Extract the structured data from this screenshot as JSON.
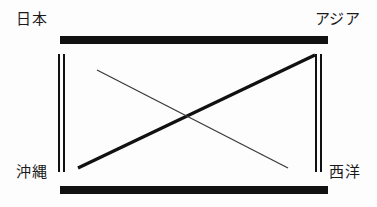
{
  "diagram": {
    "background_color": "#fdfdfd",
    "ink_color": "#111111",
    "labels": {
      "top_left": "日本",
      "top_right": "アジア",
      "bottom_left": "沖縄",
      "bottom_right": "西洋"
    },
    "frame": {
      "top_bar": "",
      "bottom_bar": "",
      "left_rule": "",
      "right_rule": ""
    },
    "connectors": {
      "thick_diagonal": "",
      "thin_diagonal": ""
    }
  },
  "chart_data": {
    "type": "diagram",
    "nodes": [
      {
        "id": "top_left",
        "label": "日本",
        "x": 24,
        "y": 20
      },
      {
        "id": "top_right",
        "label": "アジア",
        "x": 352,
        "y": 20
      },
      {
        "id": "bottom_left",
        "label": "沖縄",
        "x": 24,
        "y": 173
      },
      {
        "id": "bottom_right",
        "label": "西洋",
        "x": 352,
        "y": 173
      }
    ],
    "frame_elements": [
      {
        "id": "top_bar",
        "kind": "thick-horizontal-bar",
        "x1": 60,
        "y1": 40,
        "x2": 328,
        "y2": 40,
        "width": 8
      },
      {
        "id": "bottom_bar",
        "kind": "thick-horizontal-bar",
        "x1": 60,
        "y1": 190,
        "x2": 328,
        "y2": 190,
        "width": 8
      },
      {
        "id": "left_rule",
        "kind": "double-vertical-rule",
        "x1": 60,
        "y1": 54,
        "x2": 60,
        "y2": 172,
        "width": 2
      },
      {
        "id": "right_rule",
        "kind": "double-vertical-rule",
        "x1": 318,
        "y1": 54,
        "x2": 318,
        "y2": 172,
        "width": 2
      }
    ],
    "edges": [
      {
        "id": "thick_diagonal",
        "from": "bottom_left",
        "to": "top_right",
        "x1": 78,
        "y1": 168,
        "x2": 315,
        "y2": 55,
        "width": 3.2,
        "style": "solid"
      },
      {
        "id": "thin_diagonal",
        "from": "top_left",
        "to": "bottom_right",
        "x1": 97,
        "y1": 70,
        "x2": 288,
        "y2": 168,
        "width": 1.3,
        "style": "solid"
      }
    ],
    "crossing_point": {
      "x": 188,
      "y": 115
    },
    "grid": false,
    "legend": null
  }
}
